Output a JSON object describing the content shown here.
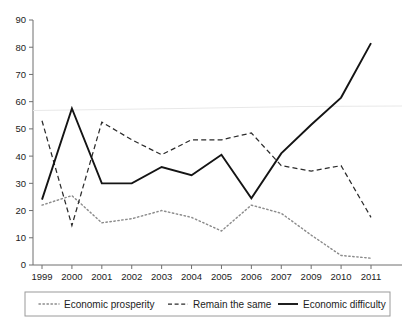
{
  "chart_data": {
    "type": "line",
    "title": "",
    "subtitle": "",
    "xlabel": "",
    "ylabel": "",
    "xlim": [
      0,
      11
    ],
    "ylim": [
      0,
      90
    ],
    "ytick_step": 10,
    "grid": false,
    "legend_position": "bottom",
    "categories": [
      "1999",
      "2000",
      "2001",
      "2002",
      "2003",
      "2004",
      "2005",
      "2006",
      "2007",
      "2009",
      "2010",
      "2011"
    ],
    "yticks": [
      "0",
      "10",
      "20",
      "30",
      "40",
      "50",
      "60",
      "70",
      "80",
      "90"
    ],
    "series": [
      {
        "name": "Economic prosperity",
        "style": "dotted",
        "color": "#8c8c8c",
        "values": [
          22,
          25.5,
          15.5,
          17,
          20,
          17.5,
          12.5,
          22,
          19,
          11,
          3.5,
          2.5
        ]
      },
      {
        "name": "Remain the same",
        "style": "dashed",
        "color": "#2b2b2b",
        "values": [
          53,
          14.5,
          52.5,
          46,
          40.5,
          46,
          46,
          48.5,
          36.5,
          34.5,
          36.5,
          17.5
        ]
      },
      {
        "name": "Economic difficulty",
        "style": "solid",
        "color": "#141414",
        "values": [
          24,
          57.5,
          30,
          30,
          36,
          33,
          40.5,
          24.5,
          41,
          51.5,
          61.5,
          81.5
        ]
      }
    ]
  },
  "legend": {
    "items": [
      {
        "label": "Economic prosperity",
        "style": "dotted"
      },
      {
        "label": "Remain the same",
        "style": "dashed"
      },
      {
        "label": "Economic difficulty",
        "style": "solid"
      }
    ]
  }
}
